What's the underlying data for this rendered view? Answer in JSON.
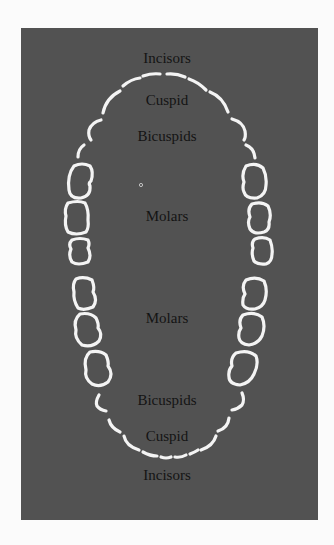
{
  "diagram": {
    "type": "dental-arch",
    "labels": {
      "upper_incisors": "Incisors",
      "upper_cuspid": "Cuspid",
      "upper_bicuspids": "Bicuspids",
      "upper_molars": "Molars",
      "lower_molars": "Molars",
      "lower_bicuspids": "Bicuspids",
      "lower_cuspid": "Cuspid",
      "lower_incisors": "Incisors"
    },
    "colors": {
      "page_background": "#fbfbfb",
      "panel_background": "#525252",
      "tooth_outline": "#f4f4f4",
      "label_text": "#141414"
    }
  }
}
